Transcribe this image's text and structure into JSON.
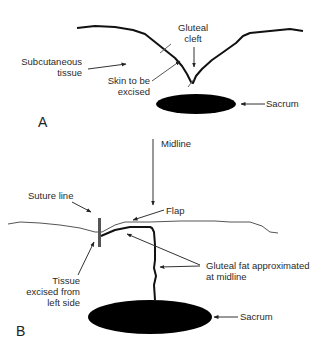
{
  "figure": {
    "panel_a": {
      "letter": "A",
      "labels": {
        "gluteal_cleft_1": "Gluteal",
        "gluteal_cleft_2": "cleft",
        "subcutaneous_1": "Subcutaneous",
        "subcutaneous_2": "tissue",
        "skin_1": "Skin to be",
        "skin_2": "excised",
        "sacrum": "Sacrum"
      }
    },
    "panel_b": {
      "letter": "B",
      "labels": {
        "midline": "Midline",
        "suture_line": "Suture line",
        "flap": "Flap",
        "gluteal_fat_1": "Gluteal fat approximated",
        "gluteal_fat_2": "at midline",
        "tissue_1": "Tissue",
        "tissue_2": "excised from",
        "tissue_3": "left side",
        "sacrum": "Sacrum"
      }
    },
    "colors": {
      "ink": "#111111",
      "gray_line": "#555555",
      "sacrum_fill": "#000000",
      "suture_bar": "#555555"
    }
  }
}
